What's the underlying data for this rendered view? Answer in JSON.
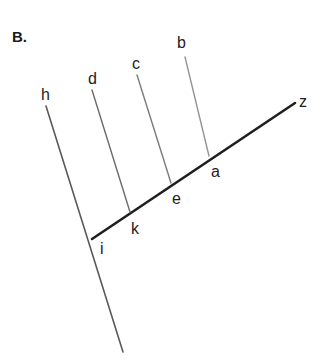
{
  "figure": {
    "panel_label": "B.",
    "background_color": "#ffffff",
    "width": 323,
    "height": 364
  },
  "chart_data": {
    "type": "diagram",
    "title": "B.",
    "subtitle": "",
    "xlabel": "",
    "ylabel": "",
    "grid": false,
    "legend": null,
    "xlim": [
      0,
      323
    ],
    "ylim": [
      0,
      364
    ],
    "lines": [
      {
        "name": "backbone-i-z",
        "label_start": "i",
        "label_end": "z",
        "x1": 92,
        "y1": 239,
        "x2": 295,
        "y2": 103,
        "color": "#1f1f1f",
        "width": 2.6
      },
      {
        "name": "branch-h",
        "label_start": "h",
        "label_end": "",
        "x1": 46,
        "y1": 106,
        "x2": 123,
        "y2": 352,
        "color": "#5a5a5a",
        "width": 1.6
      },
      {
        "name": "branch-d",
        "label_start": "d",
        "label_end": "k",
        "x1": 92,
        "y1": 90,
        "x2": 130,
        "y2": 212,
        "color": "#6b6b6b",
        "width": 1.4
      },
      {
        "name": "branch-c",
        "label_start": "c",
        "label_end": "e",
        "x1": 137,
        "y1": 75,
        "x2": 171,
        "y2": 183,
        "color": "#7a7a7a",
        "width": 1.4
      },
      {
        "name": "branch-b",
        "label_start": "b",
        "label_end": "a",
        "x1": 185,
        "y1": 57,
        "x2": 209,
        "y2": 156,
        "color": "#949494",
        "width": 1.4
      }
    ],
    "nodes": [
      {
        "name": "node-i",
        "label": "i",
        "x": 92,
        "y": 239
      },
      {
        "name": "node-k",
        "label": "k",
        "x": 130,
        "y": 212
      },
      {
        "name": "node-e",
        "label": "e",
        "x": 171,
        "y": 183
      },
      {
        "name": "node-a",
        "label": "a",
        "x": 209,
        "y": 156
      }
    ],
    "labels": [
      {
        "name": "label-h",
        "text": "h",
        "x": 41,
        "y": 87
      },
      {
        "name": "label-d",
        "text": "d",
        "x": 88,
        "y": 71
      },
      {
        "name": "label-c",
        "text": "c",
        "x": 132,
        "y": 56
      },
      {
        "name": "label-b",
        "text": "b",
        "x": 177,
        "y": 35
      },
      {
        "name": "label-z",
        "text": "z",
        "x": 299,
        "y": 94
      },
      {
        "name": "label-a",
        "text": "a",
        "x": 211,
        "y": 164
      },
      {
        "name": "label-e",
        "text": "e",
        "x": 172,
        "y": 191
      },
      {
        "name": "label-k",
        "text": "k",
        "x": 131,
        "y": 221
      },
      {
        "name": "label-i",
        "text": "i",
        "x": 100,
        "y": 241
      }
    ]
  }
}
